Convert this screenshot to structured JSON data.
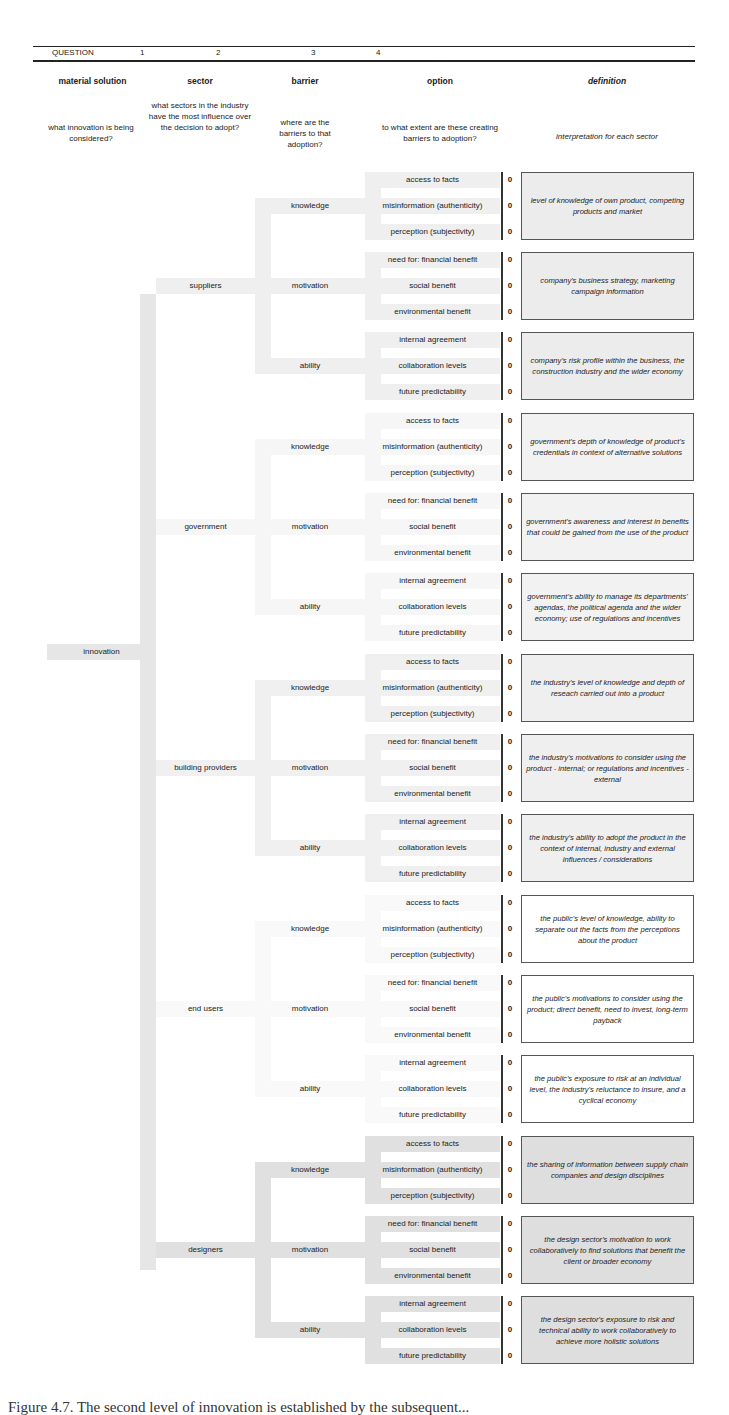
{
  "header": {
    "question_label": "QUESTION",
    "numbers": [
      "1",
      "2",
      "3",
      "4"
    ],
    "columns": [
      {
        "title": "material solution",
        "description": "what innovation is being considered?"
      },
      {
        "title": "sector",
        "description": "what sectors in the industry have the most influence over the decision to adopt?"
      },
      {
        "title": "barrier",
        "description": "where are the barriers to that adoption?"
      },
      {
        "title": "option",
        "description": "to what extent are these creating barriers to adoption?"
      },
      {
        "title": "definition",
        "description": "interpretation for each sector"
      }
    ]
  },
  "root": {
    "label": "innovation"
  },
  "barriers": [
    "knowledge",
    "motivation",
    "ability"
  ],
  "options": {
    "knowledge": [
      "access to facts",
      "misinformation (authenticity)",
      "perception (subjectivity)"
    ],
    "motivation": [
      "need for: financial benefit",
      "social benefit",
      "environmental benefit"
    ],
    "ability": [
      "internal agreement",
      "collaboration levels",
      "future predictability"
    ]
  },
  "sectors": [
    {
      "name": "suppliers",
      "shade": "#efefef",
      "box_bg": "#ececec",
      "scores": [
        0,
        0,
        0,
        0,
        0,
        0,
        0,
        0,
        0
      ],
      "definitions": [
        "level of knowledge of own product, competing products and market",
        "company's business strategy, marketing campaign information",
        "company's risk profile within the business, the construction industry and the wider economy"
      ]
    },
    {
      "name": "government",
      "shade": "#f6f6f6",
      "box_bg": "#f2f2f2",
      "scores": [
        0,
        0,
        0,
        0,
        0,
        0,
        0,
        0,
        0
      ],
      "definitions": [
        "government's depth of knowledge of product's credentials in context of alternative solutions",
        "government's awareness and interest in benefits that could be gained from the use of the product",
        "government's ability to manage its departments' agendas, the political agenda and the wider economy; use of regulations and incentives"
      ]
    },
    {
      "name": "building providers",
      "shade": "#f0f0f0",
      "box_bg": "#efefef",
      "scores": [
        0,
        0,
        0,
        0,
        0,
        0,
        0,
        0,
        0
      ],
      "definitions": [
        "the industry's level of knowledge and depth of reseach carried out into a product",
        "the industry's motivations to consider using the product - internal; or regulations and incentives - external",
        "the industry's ability to adopt the product in the context of internal, industry and external influences / considerations"
      ]
    },
    {
      "name": "end users",
      "shade": "#f9f9f9",
      "box_bg": "#ffffff",
      "scores": [
        0,
        0,
        0,
        0,
        0,
        0,
        0,
        0,
        0
      ],
      "definitions": [
        "the public's level of knowledge, ability to separate out the facts from the perceptions about the product",
        "the public's motivations to consider using the product; direct benefit, need to invest, long-term payback",
        "the public's exposure to risk at an individual level, the industry's reluctance to insure, and a cyclical economy"
      ]
    },
    {
      "name": "designers",
      "shade": "#e0e0e0",
      "box_bg": "#dedede",
      "scores": [
        0,
        0,
        0,
        0,
        0,
        0,
        0,
        0,
        0
      ],
      "definitions": [
        "the sharing of information between supply chain companies and design disciplines",
        "the design sector's motivation to work collaboratively to  find solutions that benefit the client or broader economy",
        "the design sector's exposure to risk and technical ability to work collaboratively to achieve more holistic solutions"
      ]
    }
  ],
  "colors": {
    "root_bar": "#e6e6e6",
    "rule": "#222222"
  },
  "caption": "Figure 4.7. The second level of innovation is established by the subsequent..."
}
